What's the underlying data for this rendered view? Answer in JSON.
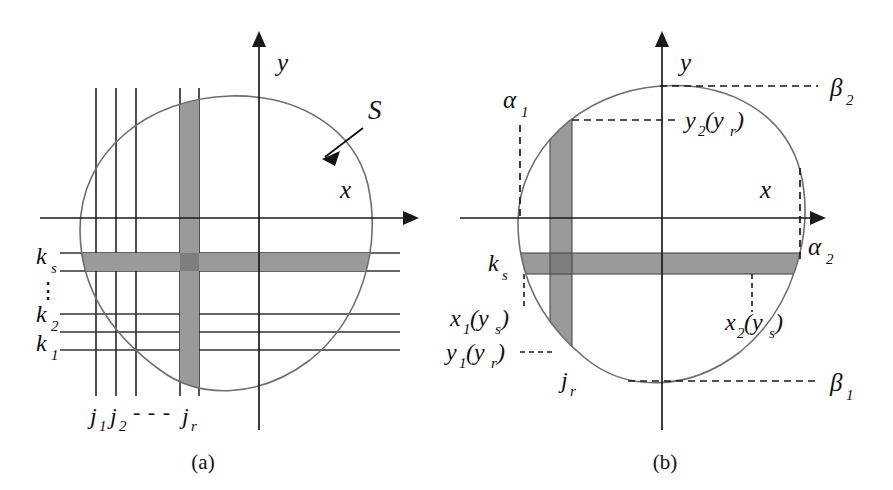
{
  "figure": {
    "kind": "math-diagram",
    "background_color": "#ffffff",
    "curve_color": "#6e6e6e",
    "band_color": "#9a9a9a",
    "band_intersection_color": "#7e7e7e",
    "line_color": "#333333",
    "text_color": "#111111"
  },
  "panel_a": {
    "caption": "(a)",
    "axis_x_label": "x",
    "axis_y_label": "y",
    "region_label": "S",
    "vertical_line_labels": [
      "j",
      "j",
      "j"
    ],
    "vertical_line_subscripts": [
      "1",
      "2",
      "r"
    ],
    "vertical_dots": "- - -",
    "horizontal_line_labels": [
      "k",
      "k",
      "k"
    ],
    "horizontal_line_subscripts": [
      "s",
      "2",
      "1"
    ],
    "horizontal_dots": "⋮",
    "grid": {
      "vertical_count": 5,
      "horizontal_count": 5
    }
  },
  "panel_b": {
    "caption": "(b)",
    "axis_x_label": "x",
    "axis_y_label": "y",
    "labels": {
      "alpha_1_base": "α",
      "alpha_1_sub": "1",
      "alpha_2_base": "α",
      "alpha_2_sub": "2",
      "beta_1_base": "β",
      "beta_1_sub": "1",
      "beta_2_base": "β",
      "beta_2_sub": "2",
      "k_s_base": "k",
      "k_s_sub": "s",
      "j_r_base": "j",
      "j_r_sub": "r",
      "y2_base": "y",
      "y2_sub": "2",
      "y2_arg": "(y",
      "y2_arg_sub": "r",
      "y2_close": ")",
      "y1_base": "y",
      "y1_sub": "1",
      "y1_arg": "(y",
      "y1_arg_sub": "r",
      "y1_close": ")",
      "x1_base": "x",
      "x1_sub": "1",
      "x1_arg": "(y",
      "x1_arg_sub": "s",
      "x1_close": ")",
      "x2_base": "x",
      "x2_sub": "2",
      "x2_arg": "(y",
      "x2_arg_sub": "s",
      "x2_close": ")"
    }
  }
}
